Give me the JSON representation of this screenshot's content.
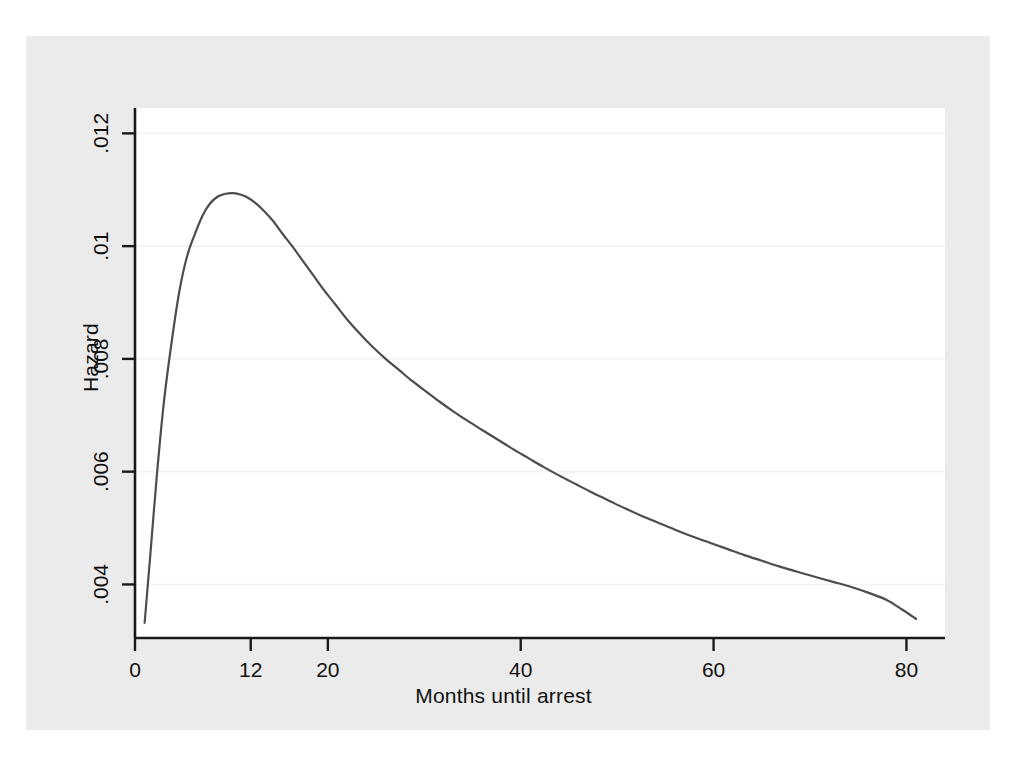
{
  "chart_data": {
    "type": "line",
    "title": "",
    "xlabel": "Months until arrest",
    "ylabel": "Hazard",
    "xlim": [
      0,
      84
    ],
    "ylim": [
      0.00305,
      0.01245
    ],
    "xticks": [
      0,
      12,
      20,
      40,
      60,
      80
    ],
    "xtick_labels": [
      "0",
      "12",
      "20",
      "40",
      "60",
      "80"
    ],
    "yticks": [
      0.004,
      0.006,
      0.008,
      0.01,
      0.012
    ],
    "ytick_labels": [
      ".004",
      ".006",
      ".008",
      ".01",
      ".012"
    ],
    "grid": "horizontal",
    "legend": "none",
    "series": [
      {
        "name": "Hazard",
        "color": "#4d4d4d",
        "x": [
          1,
          1.6,
          2.3,
          3,
          3.8,
          4.6,
          5.4,
          6.2,
          7,
          7.8,
          8.6,
          9.4,
          10.2,
          11,
          11.8,
          12.6,
          13.4,
          14.3,
          15.3,
          16.3,
          17.4,
          18.5,
          19.6,
          20.8,
          22,
          23.3,
          24.6,
          26,
          27.4,
          28.8,
          30.2,
          31.6,
          33,
          34.5,
          36,
          37.6,
          39.2,
          40.8,
          42.4,
          44,
          45.7,
          47.4,
          49.1,
          50.8,
          52.5,
          54.2,
          56,
          57.8,
          59.6,
          61.4,
          63.2,
          65,
          66.8,
          68.6,
          70.4,
          72.3,
          74.2,
          76.1,
          78,
          79.5,
          81
        ],
        "y": [
          0.00332,
          0.00455,
          0.006,
          0.00724,
          0.0083,
          0.0092,
          0.00982,
          0.01021,
          0.01054,
          0.01076,
          0.01088,
          0.01093,
          0.01094,
          0.01091,
          0.01085,
          0.01075,
          0.01062,
          0.01045,
          0.01022,
          0.01,
          0.00974,
          0.00948,
          0.00922,
          0.00896,
          0.0087,
          0.00845,
          0.00822,
          0.008,
          0.0078,
          0.0076,
          0.00742,
          0.00724,
          0.00707,
          0.0069,
          0.00674,
          0.00657,
          0.0064,
          0.00624,
          0.00608,
          0.00593,
          0.00578,
          0.00563,
          0.00549,
          0.00535,
          0.00522,
          0.0051,
          0.00497,
          0.00485,
          0.00474,
          0.00463,
          0.00452,
          0.00442,
          0.00432,
          0.00423,
          0.00414,
          0.00405,
          0.00396,
          0.00385,
          0.00372,
          0.00356,
          0.00339
        ]
      }
    ]
  },
  "figure": {
    "background_color": "#ffffff",
    "panel_color": "#ebebeb",
    "plot_area_color": "#ffffff",
    "grid_color": "#f2f2f2",
    "axis_color": "#000000",
    "line_color": "#4d4d4d"
  }
}
